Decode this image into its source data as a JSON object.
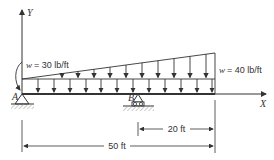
{
  "diagram": {
    "type": "beam-loading",
    "axes": {
      "x_label": "X",
      "y_label": "Y"
    },
    "supports": [
      {
        "id": "A",
        "label": "A",
        "kind": "pin"
      },
      {
        "id": "B",
        "label": "B",
        "kind": "roller"
      }
    ],
    "loads": {
      "left_label": "w = 30 lb/ft",
      "right_label": "w = 40 lb/ft",
      "left_symbol": "w",
      "left_value": "= 30 lb/ft",
      "right_symbol": "w",
      "right_value": "= 40 lb/ft"
    },
    "dimensions": [
      {
        "label": "20 ft",
        "from": "B",
        "to": "right end"
      },
      {
        "label": "50 ft",
        "from": "A",
        "to": "right end"
      }
    ]
  }
}
